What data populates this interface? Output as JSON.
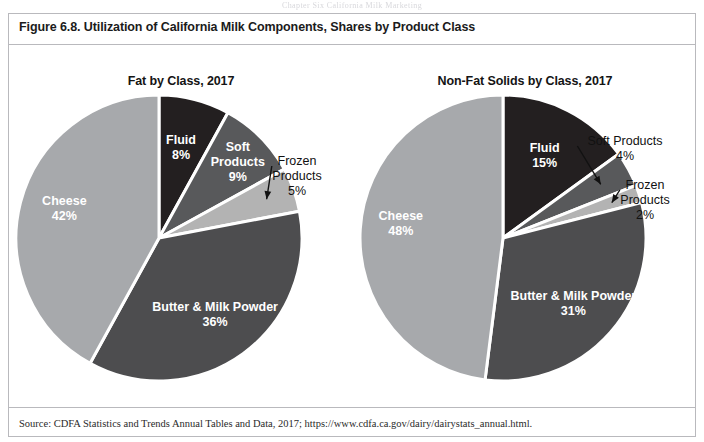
{
  "running_head": "Chapter Six  California Milk Marketing",
  "figure": {
    "title": "Figure 6.8. Utilization of California Milk Components, Shares by Product Class",
    "source": "Source: CDFA Statistics and Trends Annual Tables and Data, 2017; https://www.cdfa.ca.gov/dairy/dairystats_annual.html."
  },
  "palette": {
    "fluid": "#231f20",
    "soft_products": "#58595b",
    "frozen_products": "#b3b3b3",
    "butter_milk_powder": "#4d4d4f",
    "cheese": "#a7a9ac",
    "separator": "#ffffff",
    "text_dark": "#111111",
    "text_light": "#ffffff",
    "border": "#b9b9bd"
  },
  "chart_data": [
    {
      "type": "pie",
      "title": "Fat by Class, 2017",
      "categories": [
        "Fluid",
        "Soft Products",
        "Frozen Products",
        "Butter & Milk Powder",
        "Cheese"
      ],
      "values": [
        8,
        9,
        5,
        36,
        42
      ],
      "value_labels": [
        "8%",
        "9%",
        "5%",
        "36%",
        "42%"
      ],
      "units": "percent share",
      "start_angle_deg": 0,
      "direction": "clockwise",
      "legend": "none (slice labels)",
      "slices": [
        {
          "name": "Fluid",
          "value": 8,
          "label": "Fluid",
          "value_label": "8%",
          "color": "#231f20",
          "label_placement": "inside"
        },
        {
          "name": "Soft Products",
          "value": 9,
          "label": "Soft Products",
          "value_label": "9%",
          "color": "#58595b",
          "label_placement": "inside"
        },
        {
          "name": "Frozen Products",
          "value": 5,
          "label": "Frozen Products",
          "value_label": "5%",
          "color": "#b3b3b3",
          "label_placement": "outside-leader"
        },
        {
          "name": "Butter & Milk Powder",
          "value": 36,
          "label": "Butter & Milk Powder",
          "value_label": "36%",
          "color": "#4d4d4f",
          "label_placement": "inside"
        },
        {
          "name": "Cheese",
          "value": 42,
          "label": "Cheese",
          "value_label": "42%",
          "color": "#a7a9ac",
          "label_placement": "inside"
        }
      ]
    },
    {
      "type": "pie",
      "title": "Non-Fat Solids by Class, 2017",
      "categories": [
        "Fluid",
        "Soft Products",
        "Frozen Products",
        "Butter & Milk Powder",
        "Cheese"
      ],
      "values": [
        15,
        4,
        2,
        31,
        48
      ],
      "value_labels": [
        "15%",
        "4%",
        "2%",
        "31%",
        "48%"
      ],
      "units": "percent share",
      "start_angle_deg": 0,
      "direction": "clockwise",
      "legend": "none (slice labels)",
      "slices": [
        {
          "name": "Fluid",
          "value": 15,
          "label": "Fluid",
          "value_label": "15%",
          "color": "#231f20",
          "label_placement": "inside"
        },
        {
          "name": "Soft Products",
          "value": 4,
          "label": "Soft Products",
          "value_label": "4%",
          "color": "#58595b",
          "label_placement": "outside-leader"
        },
        {
          "name": "Frozen Products",
          "value": 2,
          "label": "Frozen Products",
          "value_label": "2%",
          "color": "#b3b3b3",
          "label_placement": "outside-leader"
        },
        {
          "name": "Butter & Milk Powder",
          "value": 31,
          "label": "Butter & Milk Powder",
          "value_label": "31%",
          "color": "#4d4d4f",
          "label_placement": "inside"
        },
        {
          "name": "Cheese",
          "value": 48,
          "label": "Cheese",
          "value_label": "48%",
          "color": "#a7a9ac",
          "label_placement": "inside"
        }
      ]
    }
  ]
}
